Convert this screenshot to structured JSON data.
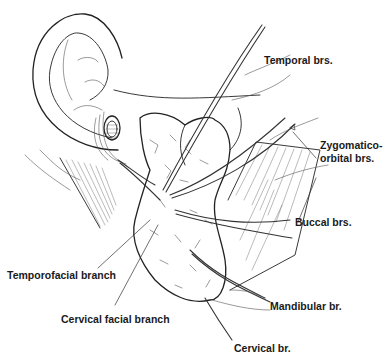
{
  "figure": {
    "labels": {
      "temporal": "Temporal brs.",
      "zygomatico_line1": "Zygomatico-",
      "zygomatico_line2": "orbital brs.",
      "buccal": "Buccal brs.",
      "temporofacial": "Temporofacial branch",
      "cervical_facial": "Cervical facial branch",
      "mandibular": "Mandibular br.",
      "cervical": "Cervical br."
    },
    "colors": {
      "background": "#ffffff",
      "line": "#222222",
      "text": "#1a1a1a"
    }
  }
}
